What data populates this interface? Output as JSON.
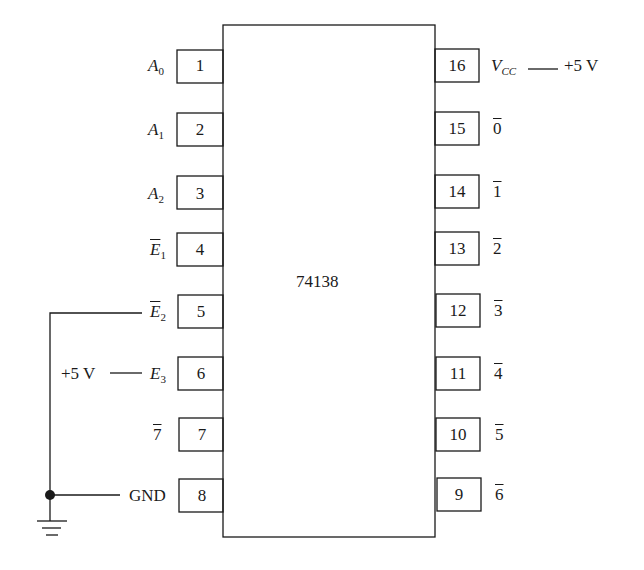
{
  "chip": {
    "part_number": "74138",
    "left_pins": [
      {
        "number": "1",
        "signal": "A",
        "sub": "0",
        "overbar": false
      },
      {
        "number": "2",
        "signal": "A",
        "sub": "1",
        "overbar": false
      },
      {
        "number": "3",
        "signal": "A",
        "sub": "2",
        "overbar": false
      },
      {
        "number": "4",
        "signal": "E",
        "sub": "1",
        "overbar": true
      },
      {
        "number": "5",
        "signal": "E",
        "sub": "2",
        "overbar": true
      },
      {
        "number": "6",
        "signal": "E",
        "sub": "3",
        "overbar": false
      },
      {
        "number": "7",
        "signal": "7",
        "sub": "",
        "overbar": true
      },
      {
        "number": "8",
        "signal": "GND",
        "sub": "",
        "overbar": false
      }
    ],
    "right_pins": [
      {
        "number": "16",
        "signal": "V",
        "sub": "CC",
        "overbar": false
      },
      {
        "number": "15",
        "signal": "0",
        "sub": "",
        "overbar": true
      },
      {
        "number": "14",
        "signal": "1",
        "sub": "",
        "overbar": true
      },
      {
        "number": "13",
        "signal": "2",
        "sub": "",
        "overbar": true
      },
      {
        "number": "12",
        "signal": "3",
        "sub": "",
        "overbar": true
      },
      {
        "number": "11",
        "signal": "4",
        "sub": "",
        "overbar": true
      },
      {
        "number": "10",
        "signal": "5",
        "sub": "",
        "overbar": true
      },
      {
        "number": "9",
        "signal": "6",
        "sub": "",
        "overbar": true
      }
    ]
  },
  "connections": {
    "vcc_supply": "+5 V",
    "e3_supply": "+5 V",
    "gnd_label": "GND"
  }
}
